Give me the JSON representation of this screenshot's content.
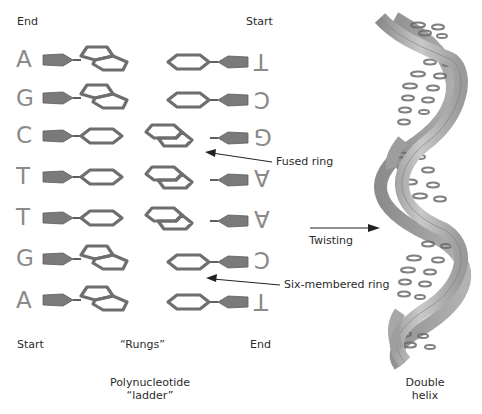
{
  "ladder": {
    "top_left_label": "End",
    "top_right_label": "Start",
    "bottom_left_label": "Start",
    "bottom_middle_label": "“Rungs”",
    "bottom_right_label": "End",
    "caption_line1": "Polynucleotide",
    "caption_line2": "“ladder”",
    "rows": [
      {
        "left": "A",
        "right": "T",
        "left_ring": "fused",
        "right_ring": "six"
      },
      {
        "left": "G",
        "right": "C",
        "left_ring": "fused",
        "right_ring": "six"
      },
      {
        "left": "C",
        "right": "G",
        "left_ring": "six",
        "right_ring": "fused"
      },
      {
        "left": "T",
        "right": "A",
        "left_ring": "six",
        "right_ring": "fused"
      },
      {
        "left": "T",
        "right": "A",
        "left_ring": "six",
        "right_ring": "fused"
      },
      {
        "left": "G",
        "right": "C",
        "left_ring": "fused",
        "right_ring": "six"
      },
      {
        "left": "A",
        "right": "T",
        "left_ring": "fused",
        "right_ring": "six"
      }
    ]
  },
  "annotations": {
    "fused_ring": "Fused ring",
    "six_membered_ring": "Six-membered ring",
    "twisting": "Twisting"
  },
  "helix": {
    "caption_line1": "Double",
    "caption_line2": "helix"
  },
  "colors": {
    "shape_fill": "#7a7a7a",
    "shape_stroke": "#5e5e5e",
    "base_letter": "#8a8a8a",
    "helix_ribbon": "#b3b3b3",
    "helix_shadow": "#8c8c8c"
  }
}
